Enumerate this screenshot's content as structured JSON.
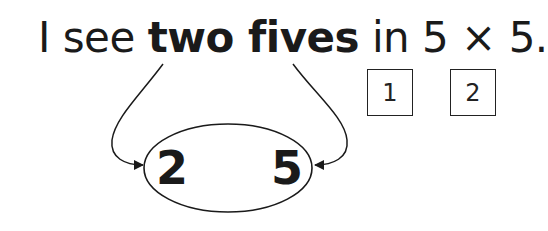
{
  "sentence": {
    "part1": "I see ",
    "bold": "two fives",
    "part2": " in 5 × 5."
  },
  "boxes": [
    {
      "label": "1"
    },
    {
      "label": "2"
    }
  ],
  "ellipse": {
    "left_digit": "2",
    "right_digit": "5"
  },
  "colors": {
    "ink": "#1a1a1a",
    "background": "#ffffff"
  }
}
